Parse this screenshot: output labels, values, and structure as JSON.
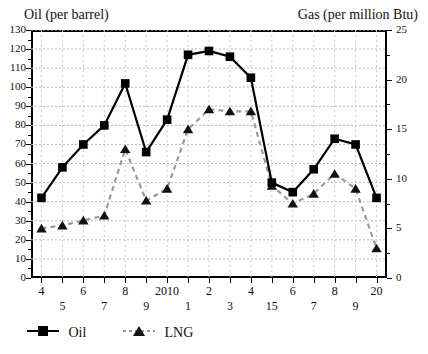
{
  "titles": {
    "left": "Oil (per barrel)",
    "right": "Gas (per million Btu)"
  },
  "legend": {
    "oil": "Oil",
    "lng": "LNG"
  },
  "chart_data": {
    "type": "line",
    "title": "",
    "xlabel": "",
    "ylabel": "Oil (per barrel)",
    "y2label": "Gas (per million Btu)",
    "grid": true,
    "legend_position": "bottom-left",
    "x": [
      "4",
      "5",
      "6",
      "7",
      "8",
      "9",
      "2010",
      "1",
      "2",
      "3",
      "4",
      "15",
      "6",
      "7",
      "8",
      "9",
      "20"
    ],
    "xticklabels": [
      "4",
      "5",
      "6",
      "7",
      "8",
      "9",
      "2010",
      "1",
      "2",
      "3",
      "4",
      "15",
      "6",
      "7",
      "8",
      "9",
      "20"
    ],
    "ylim": [
      0,
      130
    ],
    "yticks": [
      0,
      10,
      20,
      30,
      40,
      50,
      60,
      70,
      80,
      90,
      100,
      110,
      120,
      130
    ],
    "y2lim": [
      0,
      25
    ],
    "y2ticks": [
      0,
      5,
      10,
      15,
      20,
      25
    ],
    "series": [
      {
        "name": "Oil",
        "axis": "left",
        "marker": "square",
        "linestyle": "solid",
        "color": "#000000",
        "values": [
          42,
          58,
          70,
          80,
          102,
          66,
          83,
          117,
          119,
          116,
          105,
          50,
          45,
          57,
          73,
          70,
          42
        ]
      },
      {
        "name": "LNG",
        "axis": "right",
        "marker": "triangle",
        "linestyle": "dashed",
        "color": "#9a9a9a",
        "values": [
          5.0,
          5.3,
          5.8,
          6.3,
          13.0,
          7.8,
          9.0,
          15.0,
          17.0,
          16.8,
          16.8,
          9.3,
          7.5,
          8.5,
          10.5,
          9.0,
          3.0
        ]
      }
    ]
  }
}
